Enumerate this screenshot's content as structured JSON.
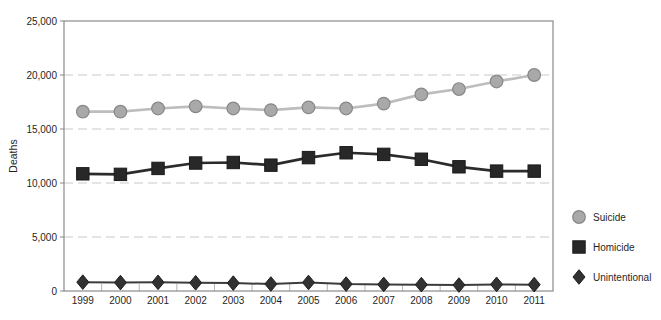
{
  "chart_data": {
    "type": "line",
    "title": "",
    "xlabel": "",
    "ylabel": "Deaths",
    "x": [
      1999,
      2000,
      2001,
      2002,
      2003,
      2004,
      2005,
      2006,
      2007,
      2008,
      2009,
      2010,
      2011
    ],
    "ylim": [
      0,
      25000
    ],
    "y_ticks": [
      {
        "value": 0,
        "label": "0"
      },
      {
        "value": 5000,
        "label": "5,000"
      },
      {
        "value": 10000,
        "label": "10,000"
      },
      {
        "value": 15000,
        "label": "15,000"
      },
      {
        "value": 20000,
        "label": "20,000"
      },
      {
        "value": 25000,
        "label": "25,000"
      }
    ],
    "grid": "horizontal dashed",
    "legend_position": "right",
    "series": [
      {
        "name": "Suicide",
        "marker": "circle",
        "line_color": "#bdbdbd",
        "line_width": 2.7,
        "marker_fill": "#a9a9a9",
        "marker_stroke": "#878787",
        "values": [
          16600,
          16600,
          16900,
          17100,
          16900,
          16750,
          17000,
          16900,
          17350,
          18200,
          18700,
          19400,
          20000
        ]
      },
      {
        "name": "Homicide",
        "marker": "square",
        "line_color": "#2b2b2b",
        "line_width": 2.7,
        "marker_fill": "#282828",
        "marker_stroke": "#1a1a1a",
        "values": [
          10850,
          10800,
          11350,
          11850,
          11900,
          11650,
          12350,
          12800,
          12650,
          12200,
          11500,
          11100,
          11100
        ]
      },
      {
        "name": "Unintentional",
        "marker": "diamond",
        "line_color": "#3c3c3c",
        "line_width": 2.0,
        "marker_fill": "#323232",
        "marker_stroke": "#1f1f1f",
        "values": [
          820,
          780,
          800,
          760,
          730,
          650,
          790,
          640,
          610,
          590,
          550,
          610,
          590
        ]
      }
    ],
    "frame_color": "#8a8a8a",
    "grid_color": "#c9c9c9",
    "band_tick_color": "#b5b5b5",
    "text_color": "#1f1f1f"
  }
}
